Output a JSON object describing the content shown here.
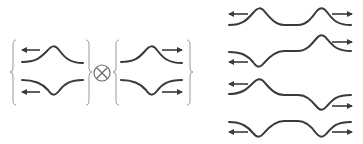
{
  "figure": {
    "operator_symbol": "⊗",
    "left_group": {
      "pairs": [
        {
          "side": "left",
          "states": [
            {
              "shape": "bump-up",
              "arrow": "left"
            },
            {
              "shape": "bump-down",
              "arrow": "left"
            }
          ]
        },
        {
          "side": "right",
          "states": [
            {
              "shape": "bump-up",
              "arrow": "right"
            },
            {
              "shape": "bump-down",
              "arrow": "right"
            }
          ]
        }
      ]
    },
    "right_group": {
      "rows": [
        {
          "bumps": [
            "up",
            "up"
          ],
          "arrows": [
            "left",
            "right"
          ]
        },
        {
          "bumps": [
            "down",
            "up"
          ],
          "arrows": [
            "left",
            "right"
          ]
        },
        {
          "bumps": [
            "up",
            "down"
          ],
          "arrows": [
            "left",
            "right"
          ]
        },
        {
          "bumps": [
            "down",
            "down"
          ],
          "arrows": [
            "left",
            "right"
          ]
        }
      ]
    },
    "colors": {
      "stroke": "#3a3a3a",
      "brace": "#9a9a9a",
      "background": "#ffffff"
    }
  }
}
